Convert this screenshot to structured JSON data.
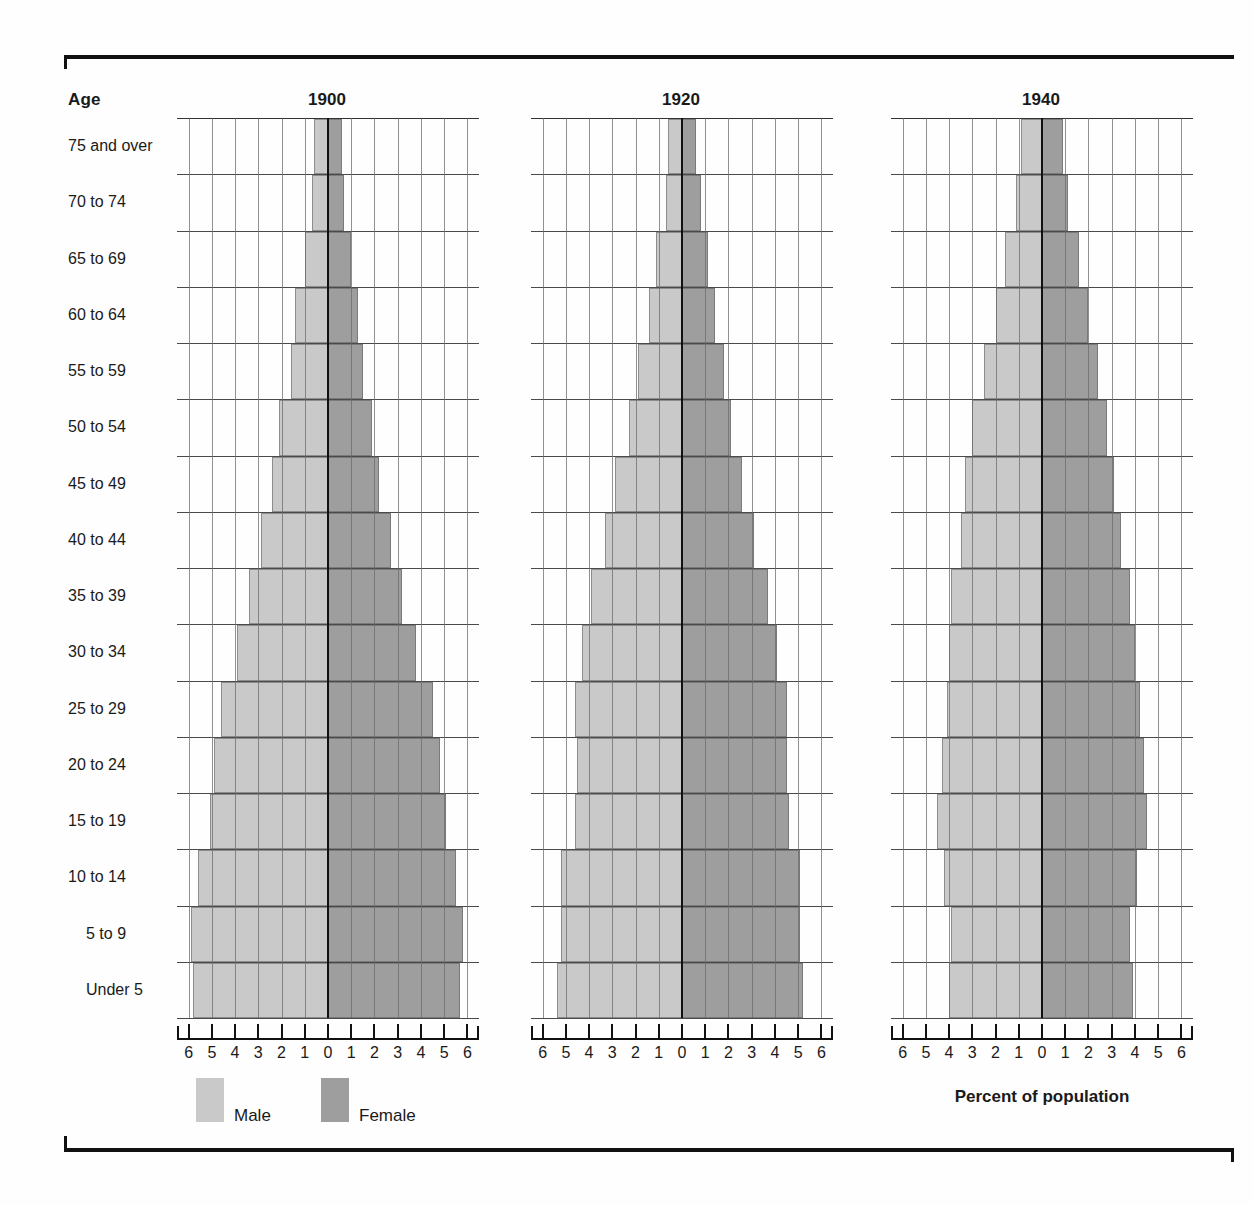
{
  "header": {
    "age_column_label": "Age",
    "axis_caption": "Percent of population"
  },
  "legend": {
    "male_label": "Male",
    "female_label": "Female",
    "male_color": "#c9c9c9",
    "female_color": "#9e9e9e"
  },
  "age_groups": [
    "75 and over",
    "70 to 74",
    "65 to 69",
    "60 to 64",
    "55 to 59",
    "50 to 54",
    "45 to 49",
    "40 to 44",
    "35 to 39",
    "30 to 34",
    "25 to 29",
    "20 to 24",
    "15 to 19",
    "10 to 14",
    "5 to 9",
    "Under 5"
  ],
  "tick_labels": [
    "6",
    "5",
    "4",
    "3",
    "2",
    "1",
    "0",
    "1",
    "2",
    "3",
    "4",
    "5",
    "6"
  ],
  "chart_data": [
    {
      "type": "bar",
      "title": "1900",
      "xlabel": "Percent of population",
      "ylabel": "Age",
      "xlim": [
        -6,
        6
      ],
      "axis_ticks": [
        6,
        5,
        4,
        3,
        2,
        1,
        0,
        1,
        2,
        3,
        4,
        5,
        6
      ],
      "grid": true,
      "legend_position": "bottom-left",
      "categories": [
        "75 and over",
        "70 to 74",
        "65 to 69",
        "60 to 64",
        "55 to 59",
        "50 to 54",
        "45 to 49",
        "40 to 44",
        "35 to 39",
        "30 to 34",
        "25 to 29",
        "20 to 24",
        "15 to 19",
        "10 to 14",
        "5 to 9",
        "Under 5"
      ],
      "series": [
        {
          "name": "Male",
          "values": [
            0.6,
            0.7,
            1.0,
            1.4,
            1.6,
            2.1,
            2.4,
            2.9,
            3.4,
            3.9,
            4.6,
            4.9,
            5.1,
            5.6,
            5.9,
            5.8
          ]
        },
        {
          "name": "Female",
          "values": [
            0.6,
            0.7,
            1.0,
            1.3,
            1.5,
            1.9,
            2.2,
            2.7,
            3.2,
            3.8,
            4.5,
            4.8,
            5.1,
            5.5,
            5.8,
            5.7
          ]
        }
      ]
    },
    {
      "type": "bar",
      "title": "1920",
      "xlabel": "Percent of population",
      "ylabel": "Age",
      "xlim": [
        -6,
        6
      ],
      "axis_ticks": [
        6,
        5,
        4,
        3,
        2,
        1,
        0,
        1,
        2,
        3,
        4,
        5,
        6
      ],
      "grid": true,
      "categories": [
        "75 and over",
        "70 to 74",
        "65 to 69",
        "60 to 64",
        "55 to 59",
        "50 to 54",
        "45 to 49",
        "40 to 44",
        "35 to 39",
        "30 to 34",
        "25 to 29",
        "20 to 24",
        "15 to 19",
        "10 to 14",
        "5 to 9",
        "Under 5"
      ],
      "series": [
        {
          "name": "Male",
          "values": [
            0.6,
            0.7,
            1.1,
            1.4,
            1.9,
            2.3,
            2.9,
            3.3,
            3.9,
            4.3,
            4.6,
            4.5,
            4.6,
            5.2,
            5.2,
            5.4
          ]
        },
        {
          "name": "Female",
          "values": [
            0.6,
            0.8,
            1.1,
            1.4,
            1.8,
            2.1,
            2.6,
            3.1,
            3.7,
            4.1,
            4.5,
            4.5,
            4.6,
            5.1,
            5.1,
            5.2
          ]
        }
      ]
    },
    {
      "type": "bar",
      "title": "1940",
      "xlabel": "Percent of population",
      "ylabel": "Age",
      "xlim": [
        -6,
        6
      ],
      "axis_ticks": [
        6,
        5,
        4,
        3,
        2,
        1,
        0,
        1,
        2,
        3,
        4,
        5,
        6
      ],
      "grid": true,
      "categories": [
        "75 and over",
        "70 to 74",
        "65 to 69",
        "60 to 64",
        "55 to 59",
        "50 to 54",
        "45 to 49",
        "40 to 44",
        "35 to 39",
        "30 to 34",
        "25 to 29",
        "20 to 24",
        "15 to 19",
        "10 to 14",
        "5 to 9",
        "Under 5"
      ],
      "series": [
        {
          "name": "Male",
          "values": [
            0.9,
            1.1,
            1.6,
            2.0,
            2.5,
            3.0,
            3.3,
            3.5,
            3.9,
            4.0,
            4.1,
            4.3,
            4.5,
            4.2,
            3.9,
            4.0
          ]
        },
        {
          "name": "Female",
          "values": [
            0.9,
            1.1,
            1.6,
            2.0,
            2.4,
            2.8,
            3.1,
            3.4,
            3.8,
            4.0,
            4.2,
            4.4,
            4.5,
            4.1,
            3.8,
            3.9
          ]
        }
      ]
    }
  ]
}
